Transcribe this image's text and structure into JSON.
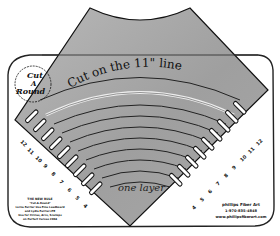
{
  "illustration": {
    "subject": "Cut A Round quilting ruler with folded fabric",
    "logo": {
      "line1": "Cut",
      "line2": "A",
      "line3": "Round",
      "tm": "TM"
    },
    "fabric": {
      "color": "#a9a9a9",
      "instruction_text": "Cut on the 11\" line",
      "layer_label": "one layer"
    },
    "ruler": {
      "color": "#ffffff",
      "outline_color": "#222222",
      "left_tick_numbers": [
        "12",
        "11",
        "10",
        "9",
        "8",
        "7",
        "6",
        "5",
        "4"
      ],
      "right_tick_numbers": [
        "12",
        "11",
        "10",
        "9",
        "8",
        "7",
        "6",
        "5",
        "4"
      ],
      "left_small_print": [
        "THE NEW RULE",
        "\"Cut-A-Round\"",
        "Lorna Ferrier Use Fine Leadboard",
        "and Lydia Ferrier-LTE",
        "Use for Circles, Arcs, Scallops",
        "on Perfect Curves 2004"
      ],
      "right_small_print": [
        "phillips Fiber Art",
        "1-970-835-4848",
        "www.phillipsfiberart.com"
      ]
    }
  }
}
